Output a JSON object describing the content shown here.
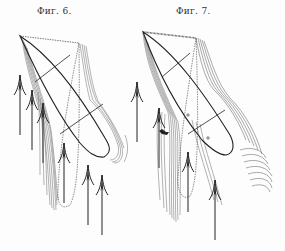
{
  "figures": [
    {
      "caption": "Фиг. 6.",
      "description": "Elongated elliptical body in upward flow, with streamline shading on left and right flanks and upward arrows"
    },
    {
      "caption": "Фиг. 7.",
      "description": "Elongated elliptical body in upward flow, with denser streamlines and curved wake lines on the lower right"
    }
  ],
  "colors": {
    "ink": "#222222",
    "shade": "#555555",
    "background": "#fdfdfd"
  }
}
